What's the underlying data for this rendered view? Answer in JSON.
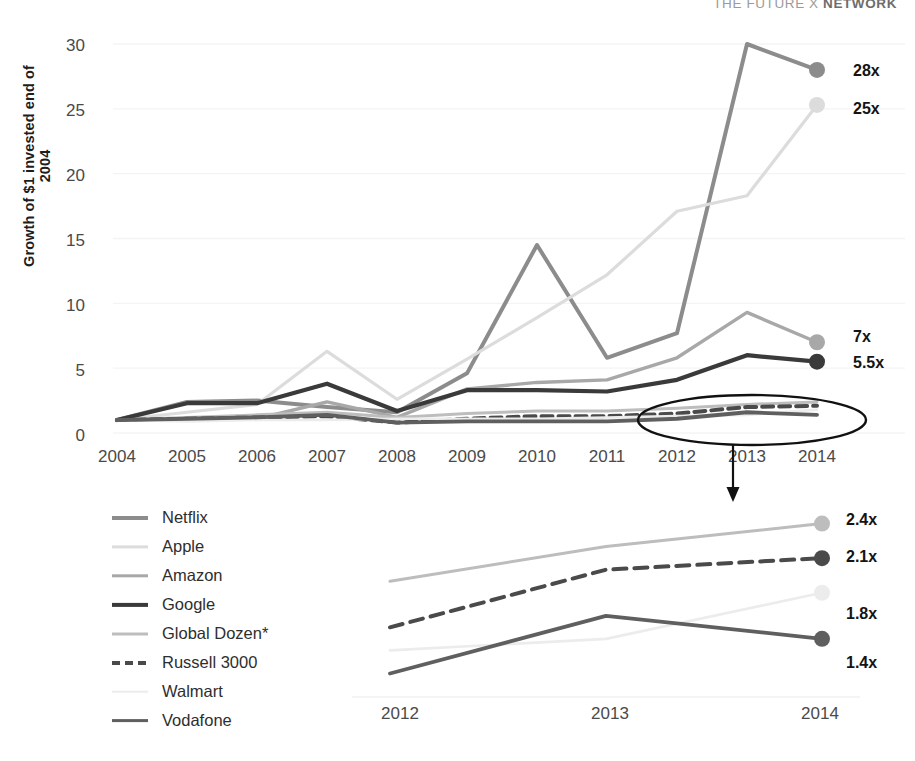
{
  "brand": {
    "prefix": "THE FUTURE X ",
    "suffix": "NETWORK"
  },
  "axis": {
    "ylabel": "Growth of $1 invested end of 2004",
    "yticks": [
      "30",
      "25",
      "20",
      "15",
      "10",
      "5",
      "0"
    ],
    "xticks": [
      "2004",
      "2005",
      "2006",
      "2007",
      "2008",
      "2009",
      "2010",
      "2011",
      "2012",
      "2013",
      "2014"
    ],
    "inset_xticks": [
      "2012",
      "2013",
      "2014"
    ]
  },
  "legend": [
    {
      "label": "Netflix",
      "color": "#8c8c8c",
      "width": 4.0,
      "dash": "none"
    },
    {
      "label": "Apple",
      "color": "#dcdcdc",
      "width": 3.2,
      "dash": "none"
    },
    {
      "label": "Amazon",
      "color": "#a8a8a8",
      "width": 3.4,
      "dash": "none"
    },
    {
      "label": "Google",
      "color": "#3a3a3a",
      "width": 4.2,
      "dash": "none"
    },
    {
      "label": "Global Dozen*",
      "color": "#bdbdbd",
      "width": 3.0,
      "dash": "none"
    },
    {
      "label": "Russell 3000",
      "color": "#4a4a4a",
      "width": 4.0,
      "dash": "dashed"
    },
    {
      "label": "Walmart",
      "color": "#ececec",
      "width": 2.6,
      "dash": "none"
    },
    {
      "label": "Vodafone",
      "color": "#5f5f5f",
      "width": 3.8,
      "dash": "none"
    }
  ],
  "end_labels": {
    "main": [
      "28x",
      "25x",
      "7x",
      "5.5x"
    ],
    "inset": [
      "2.4x",
      "2.1x",
      "1.8x",
      "1.4x"
    ]
  },
  "chart_data": {
    "type": "line",
    "title": "",
    "xlabel": "",
    "ylabel": "Growth of $1 invested end of 2004",
    "x": [
      2004,
      2005,
      2006,
      2007,
      2008,
      2009,
      2010,
      2011,
      2012,
      2013,
      2014
    ],
    "xlim": [
      2004,
      2014
    ],
    "ylim": [
      0,
      30
    ],
    "yticks": [
      0,
      5,
      10,
      15,
      20,
      25,
      30
    ],
    "grid": true,
    "legend_position": "bottom-left",
    "series": [
      {
        "name": "Netflix",
        "color": "#8c8c8c",
        "values": [
          1.0,
          2.4,
          2.5,
          2.0,
          1.6,
          4.6,
          14.5,
          5.8,
          7.7,
          30.0,
          28.0
        ],
        "end_label": "28x"
      },
      {
        "name": "Apple",
        "color": "#dcdcdc",
        "values": [
          1.0,
          1.6,
          2.2,
          6.3,
          2.6,
          5.7,
          8.9,
          12.2,
          17.1,
          18.3,
          25.3
        ],
        "end_label": "25x"
      },
      {
        "name": "Amazon",
        "color": "#a8a8a8",
        "values": [
          1.0,
          1.0,
          1.1,
          2.4,
          1.2,
          3.4,
          3.9,
          4.1,
          5.8,
          9.3,
          7.0
        ],
        "end_label": "7x"
      },
      {
        "name": "Google",
        "color": "#3a3a3a",
        "values": [
          1.0,
          2.3,
          2.3,
          3.8,
          1.7,
          3.3,
          3.3,
          3.2,
          4.1,
          6.0,
          5.5
        ],
        "end_label": "5.5x"
      },
      {
        "name": "Global Dozen*",
        "color": "#bdbdbd",
        "values": [
          1.0,
          1.2,
          1.4,
          1.6,
          1.2,
          1.5,
          1.7,
          1.7,
          1.9,
          2.2,
          2.4
        ],
        "end_label": "2.4x"
      },
      {
        "name": "Russell 3000",
        "color": "#4a4a4a",
        "values": [
          1.0,
          1.1,
          1.2,
          1.3,
          0.8,
          1.1,
          1.3,
          1.3,
          1.5,
          2.0,
          2.1
        ],
        "end_label": "2.1x",
        "dash": "dashed"
      },
      {
        "name": "Walmart",
        "color": "#ececec",
        "values": [
          1.0,
          0.9,
          1.0,
          1.0,
          1.1,
          1.1,
          1.1,
          1.2,
          1.3,
          1.4,
          1.8
        ],
        "end_label": "1.8x"
      },
      {
        "name": "Vodafone",
        "color": "#5f5f5f",
        "values": [
          1.0,
          1.1,
          1.2,
          1.4,
          0.8,
          0.9,
          0.9,
          0.9,
          1.1,
          1.6,
          1.4
        ],
        "end_label": "1.4x"
      }
    ],
    "annotations": [
      {
        "type": "ellipse",
        "note": "highlight of flat series 2012-2014"
      },
      {
        "type": "arrow",
        "note": "points to zoomed inset panel below"
      }
    ],
    "inset": {
      "type": "line",
      "x": [
        2012,
        2013,
        2014
      ],
      "xlim": [
        2012,
        2014
      ],
      "series": [
        {
          "name": "Global Dozen*",
          "color": "#bdbdbd",
          "values": [
            1.9,
            2.2,
            2.4
          ],
          "end_label": "2.4x"
        },
        {
          "name": "Russell 3000",
          "color": "#4a4a4a",
          "values": [
            1.5,
            2.0,
            2.1
          ],
          "end_label": "2.1x",
          "dash": "dashed"
        },
        {
          "name": "Walmart",
          "color": "#ececec",
          "values": [
            1.3,
            1.4,
            1.8
          ],
          "end_label": "1.8x"
        },
        {
          "name": "Vodafone",
          "color": "#5f5f5f",
          "values": [
            1.1,
            1.6,
            1.4
          ],
          "end_label": "1.4x"
        }
      ]
    }
  }
}
